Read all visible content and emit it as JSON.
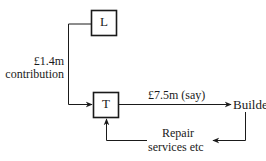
{
  "diagram": {
    "nodes": {
      "L": {
        "label": "L"
      },
      "T": {
        "label": "T"
      },
      "builder": {
        "label": "Builder"
      }
    },
    "edges": {
      "contribution": {
        "from": "L",
        "to": "T",
        "label_line1": "£1.4m",
        "label_line2": "contribution"
      },
      "payment": {
        "from": "T",
        "to": "Builder",
        "label": "£7.5m (say)"
      },
      "repair": {
        "from": "Builder",
        "to": "T",
        "label_line1": "Repair",
        "label_line2": "services etc"
      }
    },
    "colors": {
      "line": "#1a1a1a",
      "background": "#ffffff"
    }
  }
}
